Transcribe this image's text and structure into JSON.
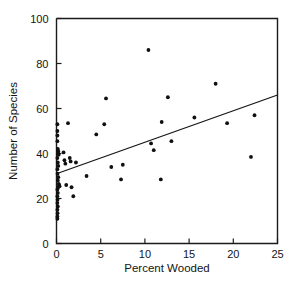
{
  "chart_data": {
    "type": "scatter",
    "title": "",
    "xlabel": "Percent Wooded",
    "ylabel": "Number of Species",
    "xlim": [
      0,
      25
    ],
    "ylim": [
      0,
      100
    ],
    "xticks": [
      0,
      5,
      10,
      15,
      20,
      25
    ],
    "yticks": [
      0,
      20,
      40,
      60,
      80,
      100
    ],
    "xticklabels": [
      "0",
      "5",
      "10",
      "15",
      "20",
      "25"
    ],
    "yticklabels": [
      "0",
      "20",
      "40",
      "60",
      "80",
      "100"
    ],
    "grid": false,
    "legend": null,
    "marker": "filled-circle",
    "marker_color": "#101010",
    "points": [
      [
        0.1,
        53.0
      ],
      [
        0.1,
        50.0
      ],
      [
        0.1,
        48.0
      ],
      [
        0.1,
        45.5
      ],
      [
        0.15,
        42.0
      ],
      [
        0.2,
        41.0
      ],
      [
        0.2,
        40.0
      ],
      [
        0.25,
        39.5
      ],
      [
        0.1,
        38.0
      ],
      [
        0.15,
        36.0
      ],
      [
        0.2,
        34.5
      ],
      [
        0.1,
        33.0
      ],
      [
        0.12,
        31.0
      ],
      [
        0.2,
        29.5
      ],
      [
        0.15,
        28.0
      ],
      [
        0.25,
        26.5
      ],
      [
        0.3,
        26.0
      ],
      [
        0.35,
        25.5
      ],
      [
        0.2,
        25.0
      ],
      [
        0.1,
        24.0
      ],
      [
        0.15,
        22.5
      ],
      [
        0.1,
        21.0
      ],
      [
        0.12,
        19.5
      ],
      [
        0.1,
        18.0
      ],
      [
        0.15,
        16.5
      ],
      [
        0.1,
        15.0
      ],
      [
        0.12,
        13.5
      ],
      [
        0.1,
        12.0
      ],
      [
        0.1,
        11.0
      ],
      [
        0.8,
        40.5
      ],
      [
        0.9,
        37.0
      ],
      [
        1.0,
        35.5
      ],
      [
        1.1,
        26.0
      ],
      [
        1.3,
        53.5
      ],
      [
        1.5,
        38.0
      ],
      [
        1.6,
        36.5
      ],
      [
        1.7,
        25.0
      ],
      [
        1.9,
        21.0
      ],
      [
        2.2,
        36.0
      ],
      [
        3.4,
        30.0
      ],
      [
        4.5,
        48.5
      ],
      [
        5.4,
        53.0
      ],
      [
        5.6,
        64.5
      ],
      [
        6.2,
        34.0
      ],
      [
        7.3,
        28.5
      ],
      [
        7.5,
        35.0
      ],
      [
        10.4,
        86.0
      ],
      [
        10.7,
        44.5
      ],
      [
        11.0,
        41.5
      ],
      [
        11.8,
        28.5
      ],
      [
        11.9,
        54.0
      ],
      [
        12.6,
        65.0
      ],
      [
        13.0,
        45.5
      ],
      [
        15.6,
        56.0
      ],
      [
        18.0,
        71.0
      ],
      [
        19.3,
        53.5
      ],
      [
        22.0,
        38.5
      ],
      [
        22.4,
        57.0
      ]
    ],
    "fit_line": {
      "type": "line",
      "x": [
        0,
        25
      ],
      "y": [
        31.0,
        66.0
      ]
    }
  }
}
